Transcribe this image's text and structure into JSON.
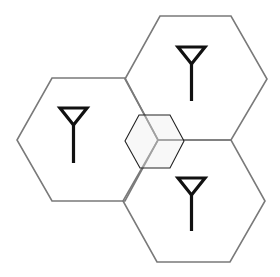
{
  "diagram": {
    "type": "cellular-network-hexagons",
    "colors": {
      "background": "#ffffff",
      "cell_stroke": "#7a7a7a",
      "overlap_stroke": "#222222",
      "antenna": "#111111"
    },
    "cells": [
      {
        "id": "cell-left",
        "points": "52,78 125,78 158,140 125,201 52,201 17,140",
        "antenna": {
          "head": "60,108 87,108 73.5,125",
          "mast": [
            73.5,
            125,
            73.5,
            163
          ]
        }
      },
      {
        "id": "cell-top-right",
        "points": "160,16 231,16 267,79 231,140 158,140 125,79",
        "antenna": {
          "head": "178,47 205,47 191.5,64",
          "mast": [
            191.5,
            64,
            191.5,
            101
          ]
        }
      },
      {
        "id": "cell-bottom-right",
        "points": "158,140 231,140 265,201 230,262 157,262 123,201",
        "antenna": {
          "head": "178,178 205,178 191.5,195",
          "mast": [
            191.5,
            195,
            191.5,
            231
          ]
        }
      }
    ],
    "overlap_cell": {
      "id": "overlap-zone",
      "points": "125,141 139,115 170,115 184,141 170,168 140,168"
    }
  }
}
